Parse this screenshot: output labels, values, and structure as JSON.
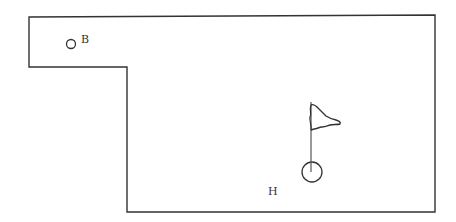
{
  "diagram": {
    "type": "golf-hole-layout",
    "stroke_color": "#333333",
    "background": "#ffffff",
    "boundary": {
      "points": [
        [
          29,
          17
        ],
        [
          435,
          15
        ],
        [
          435,
          212
        ],
        [
          127,
          212
        ],
        [
          127,
          67
        ],
        [
          29,
          67
        ]
      ]
    },
    "ball": {
      "label": "B",
      "cx": 71,
      "cy": 44,
      "r": 4.5
    },
    "hole": {
      "label": "H",
      "cx": 312,
      "cy": 172,
      "r": 10
    },
    "flag": {
      "pole_x": 311,
      "pole_top": 102,
      "pole_bottom": 172
    }
  }
}
